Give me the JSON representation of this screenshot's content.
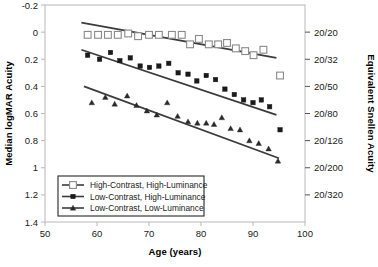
{
  "chart_data": {
    "type": "scatter",
    "title": "",
    "xlabel": "Age (years)",
    "ylabel": "Median logMAR Acuity",
    "y2label": "Equivalent Snellen Acuity",
    "xlim": [
      50,
      100
    ],
    "ylim": [
      -0.2,
      1.4
    ],
    "y_inverted": true,
    "grid": false,
    "legend_position": "bottom-left",
    "xticks": [
      50,
      60,
      70,
      80,
      90,
      100
    ],
    "xtick_labels": [
      "50",
      "60",
      "70",
      "80",
      "90",
      "100"
    ],
    "yticks": [
      -0.2,
      0,
      0.2,
      0.4,
      0.6,
      0.8,
      1,
      1.2,
      1.4
    ],
    "ytick_labels": [
      "-0.2",
      "0",
      "0.2",
      "0.4",
      "0.6",
      "0.8",
      "1",
      "1.2",
      "1.4"
    ],
    "y2ticks": [
      0.0,
      0.2,
      0.4,
      0.6,
      0.8,
      1.0,
      1.2
    ],
    "y2tick_labels": [
      "20/20",
      "20/32",
      "20/50",
      "20/80",
      "20/126",
      "20/200",
      "20/320"
    ],
    "series": [
      {
        "name": "High-Contrast, High-Luminance",
        "marker": "open-square",
        "color": "#555555",
        "fill": "#ffffff",
        "points": [
          {
            "x": 58.2,
            "y": 0.02
          },
          {
            "x": 60.2,
            "y": 0.02
          },
          {
            "x": 62.1,
            "y": 0.02
          },
          {
            "x": 64.0,
            "y": 0.02
          },
          {
            "x": 66.0,
            "y": 0.01
          },
          {
            "x": 67.9,
            "y": 0.03
          },
          {
            "x": 70.0,
            "y": 0.02
          },
          {
            "x": 71.9,
            "y": 0.02
          },
          {
            "x": 74.4,
            "y": 0.02
          },
          {
            "x": 76.3,
            "y": 0.02
          },
          {
            "x": 77.9,
            "y": 0.09
          },
          {
            "x": 79.6,
            "y": 0.05
          },
          {
            "x": 81.5,
            "y": 0.09
          },
          {
            "x": 83.3,
            "y": 0.09
          },
          {
            "x": 85.0,
            "y": 0.08
          },
          {
            "x": 86.7,
            "y": 0.12
          },
          {
            "x": 88.5,
            "y": 0.14
          },
          {
            "x": 90.1,
            "y": 0.17
          },
          {
            "x": 92.0,
            "y": 0.13
          },
          {
            "x": 95.2,
            "y": 0.32
          }
        ],
        "fit_line": {
          "x0": 57.0,
          "y0": -0.07,
          "x1": 94.5,
          "y1": 0.19
        }
      },
      {
        "name": "Low-Contrast, High-Luminance",
        "marker": "filled-square",
        "color": "#1a1a1a",
        "fill": "#1a1a1a",
        "points": [
          {
            "x": 58.2,
            "y": 0.17
          },
          {
            "x": 60.5,
            "y": 0.2
          },
          {
            "x": 62.6,
            "y": 0.15
          },
          {
            "x": 64.4,
            "y": 0.21
          },
          {
            "x": 66.4,
            "y": 0.19
          },
          {
            "x": 68.3,
            "y": 0.25
          },
          {
            "x": 70.1,
            "y": 0.26
          },
          {
            "x": 71.9,
            "y": 0.25
          },
          {
            "x": 73.8,
            "y": 0.23
          },
          {
            "x": 75.6,
            "y": 0.3
          },
          {
            "x": 77.5,
            "y": 0.31
          },
          {
            "x": 79.2,
            "y": 0.36
          },
          {
            "x": 81.0,
            "y": 0.32
          },
          {
            "x": 82.8,
            "y": 0.35
          },
          {
            "x": 84.6,
            "y": 0.42
          },
          {
            "x": 86.4,
            "y": 0.46
          },
          {
            "x": 88.2,
            "y": 0.5
          },
          {
            "x": 90.0,
            "y": 0.52
          },
          {
            "x": 91.6,
            "y": 0.5
          },
          {
            "x": 93.2,
            "y": 0.55
          },
          {
            "x": 95.2,
            "y": 0.72
          }
        ],
        "fit_line": {
          "x0": 57.0,
          "y0": 0.13,
          "x1": 94.5,
          "y1": 0.61
        }
      },
      {
        "name": "Low-Contrast, Low-Luminance",
        "marker": "filled-triangle",
        "color": "#2a2a2a",
        "fill": "#2a2a2a",
        "points": [
          {
            "x": 59.0,
            "y": 0.52
          },
          {
            "x": 61.6,
            "y": 0.48
          },
          {
            "x": 63.4,
            "y": 0.53
          },
          {
            "x": 65.8,
            "y": 0.47
          },
          {
            "x": 67.6,
            "y": 0.54
          },
          {
            "x": 69.6,
            "y": 0.58
          },
          {
            "x": 71.5,
            "y": 0.61
          },
          {
            "x": 73.5,
            "y": 0.52
          },
          {
            "x": 75.5,
            "y": 0.62
          },
          {
            "x": 77.5,
            "y": 0.66
          },
          {
            "x": 79.3,
            "y": 0.67
          },
          {
            "x": 81.0,
            "y": 0.67
          },
          {
            "x": 82.5,
            "y": 0.68
          },
          {
            "x": 84.0,
            "y": 0.63
          },
          {
            "x": 85.7,
            "y": 0.71
          },
          {
            "x": 87.5,
            "y": 0.72
          },
          {
            "x": 89.3,
            "y": 0.8
          },
          {
            "x": 91.1,
            "y": 0.82
          },
          {
            "x": 93.0,
            "y": 0.86
          },
          {
            "x": 94.8,
            "y": 0.95
          }
        ],
        "fit_line": {
          "x0": 57.5,
          "y0": 0.4,
          "x1": 95.0,
          "y1": 0.93
        }
      }
    ]
  },
  "axes": {
    "y_label": "Median logMAR Acuity",
    "y2_label": "Equivalent Snellen Acuity",
    "x_label": "Age (years)"
  },
  "legend": {
    "items": [
      {
        "label": "High-Contrast, High-Luminance",
        "marker": "open-square"
      },
      {
        "label": "Low-Contrast, High-Luminance",
        "marker": "filled-square"
      },
      {
        "label": "Low-Contrast, Low-Luminance",
        "marker": "filled-triangle"
      }
    ]
  }
}
